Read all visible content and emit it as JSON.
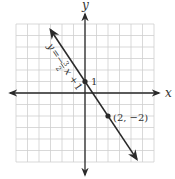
{
  "chart_data": {
    "type": "line",
    "title": "",
    "xlabel": "x",
    "ylabel": "y",
    "xlim": [
      -6,
      6
    ],
    "ylim": [
      -6,
      6
    ],
    "grid": true,
    "grid_step": 1,
    "series": [
      {
        "name": "y = -3/2 x + 1",
        "equation": "y = -(3/2)x + 1",
        "slope": -1.5,
        "intercept": 1,
        "x": [
          -3,
          4.5
        ],
        "y": [
          5.5,
          -5.75
        ],
        "arrows": "both"
      }
    ],
    "points": [
      {
        "x": 0,
        "y": 1,
        "label": "1"
      },
      {
        "x": 2,
        "y": -2,
        "label": "(2, −2)"
      }
    ],
    "annotations": [
      {
        "text": "y = −(3/2)x + 1",
        "position": "along line, upper left"
      }
    ]
  },
  "labels": {
    "x_axis": "x",
    "y_axis": "y",
    "intercept": "1",
    "point": "(2, −2)",
    "eq_y": "y",
    "eq_eq": "=",
    "eq_minus": "−",
    "eq_num": "3",
    "eq_den": "2",
    "eq_x": "x",
    "eq_plus": "+",
    "eq_one": "1"
  },
  "colors": {
    "grid": "#cfcfcf",
    "axis": "#2a2a2a",
    "line": "#2a2a2a",
    "text": "#333333"
  }
}
